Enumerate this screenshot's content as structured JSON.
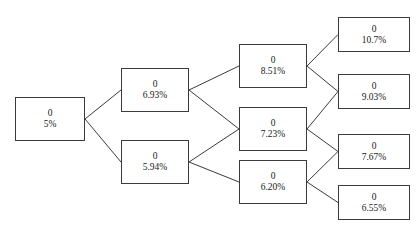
{
  "diagram": {
    "stroke_color": "#3b3b3b",
    "text_color": "#1a1a1a",
    "background_color": "#ffffff",
    "nodes": [
      {
        "id": "n0",
        "value": "0",
        "pct": "5%",
        "x": 15,
        "y": 97,
        "w": 70,
        "h": 44,
        "level": 0
      },
      {
        "id": "n1a",
        "value": "0",
        "pct": "6.93%",
        "x": 121,
        "y": 68,
        "w": 68,
        "h": 44,
        "level": 1
      },
      {
        "id": "n1b",
        "value": "0",
        "pct": "5.94%",
        "x": 121,
        "y": 140,
        "w": 68,
        "h": 44,
        "level": 1
      },
      {
        "id": "n2a",
        "value": "0",
        "pct": "8.51%",
        "x": 239,
        "y": 44,
        "w": 68,
        "h": 44,
        "level": 2
      },
      {
        "id": "n2b",
        "value": "0",
        "pct": "7.23%",
        "x": 239,
        "y": 107,
        "w": 68,
        "h": 44,
        "level": 2
      },
      {
        "id": "n2c",
        "value": "0",
        "pct": "6.20%",
        "x": 239,
        "y": 160,
        "w": 68,
        "h": 44,
        "level": 2
      },
      {
        "id": "n3a",
        "value": "0",
        "pct": "10.7%",
        "x": 338,
        "y": 17,
        "w": 72,
        "h": 35,
        "level": 3
      },
      {
        "id": "n3b",
        "value": "0",
        "pct": "9.03%",
        "x": 338,
        "y": 74,
        "w": 72,
        "h": 35,
        "level": 3
      },
      {
        "id": "n3c",
        "value": "0",
        "pct": "7.67%",
        "x": 338,
        "y": 134,
        "w": 72,
        "h": 35,
        "level": 3
      },
      {
        "id": "n3d",
        "value": "0",
        "pct": "6.55%",
        "x": 338,
        "y": 185,
        "w": 72,
        "h": 35,
        "level": 3
      }
    ],
    "edges": [
      {
        "from": "n0",
        "to": "n1a"
      },
      {
        "from": "n0",
        "to": "n1b"
      },
      {
        "from": "n1a",
        "to": "n2a"
      },
      {
        "from": "n1a",
        "to": "n2b"
      },
      {
        "from": "n1b",
        "to": "n2b"
      },
      {
        "from": "n1b",
        "to": "n2c"
      },
      {
        "from": "n2a",
        "to": "n3a"
      },
      {
        "from": "n2a",
        "to": "n3b"
      },
      {
        "from": "n2b",
        "to": "n3b"
      },
      {
        "from": "n2b",
        "to": "n3c"
      },
      {
        "from": "n2c",
        "to": "n3c"
      },
      {
        "from": "n2c",
        "to": "n3d"
      }
    ]
  }
}
